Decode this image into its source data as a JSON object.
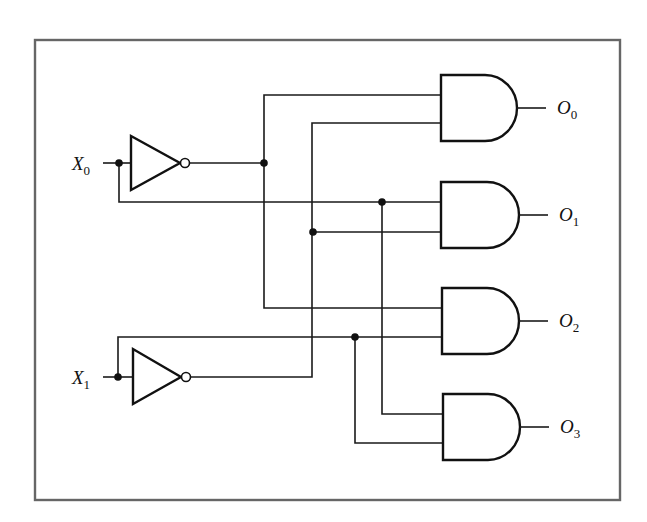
{
  "diagram": {
    "type": "2-to-4 line decoder (logic circuit)",
    "frame": {
      "border_color": "#666666"
    },
    "inputs": [
      {
        "id": "X0",
        "letter": "X",
        "subscript": "0"
      },
      {
        "id": "X1",
        "letter": "X",
        "subscript": "1"
      }
    ],
    "inverters": [
      {
        "id": "not-x0",
        "input": "X0"
      },
      {
        "id": "not-x1",
        "input": "X1"
      }
    ],
    "and_gates": [
      {
        "id": "and-0",
        "inputs": [
          "NOT X0",
          "NOT X1"
        ],
        "output": "O0"
      },
      {
        "id": "and-1",
        "inputs": [
          "X0",
          "NOT X1"
        ],
        "output": "O1"
      },
      {
        "id": "and-2",
        "inputs": [
          "NOT X0",
          "X1"
        ],
        "output": "O2"
      },
      {
        "id": "and-3",
        "inputs": [
          "X0",
          "X1"
        ],
        "output": "O3"
      }
    ],
    "outputs": [
      {
        "id": "O0",
        "letter": "O",
        "subscript": "0"
      },
      {
        "id": "O1",
        "letter": "O",
        "subscript": "1"
      },
      {
        "id": "O2",
        "letter": "O",
        "subscript": "2"
      },
      {
        "id": "O3",
        "letter": "O",
        "subscript": "3"
      }
    ],
    "colors": {
      "wire": "#1a1a1a",
      "gate_stroke": "#111111",
      "background": "#ffffff"
    }
  }
}
